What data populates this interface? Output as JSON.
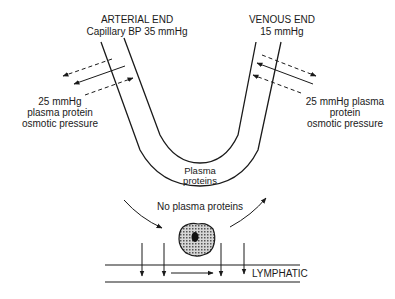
{
  "labels": {
    "arterial_title": "ARTERIAL END",
    "arterial_pressure": "Capillary BP 35 mmHg",
    "venous_title": "VENOUS END",
    "venous_pressure": "15 mmHg",
    "left_osmotic_1": "25 mmHg",
    "left_osmotic_2": "plasma protein",
    "left_osmotic_3": "osmotic pressure",
    "right_osmotic_1": "25 mmHg plasma",
    "right_osmotic_2": "protein",
    "right_osmotic_3": "osmotic pressure",
    "plasma_1": "Plasma",
    "plasma_2": "proteins",
    "no_plasma": "No plasma proteins",
    "lymphatic": "LYMPHATIC"
  },
  "colors": {
    "ink": "#1a1a1a",
    "cell_fill": "#9a9a9a",
    "background": "#ffffff"
  }
}
